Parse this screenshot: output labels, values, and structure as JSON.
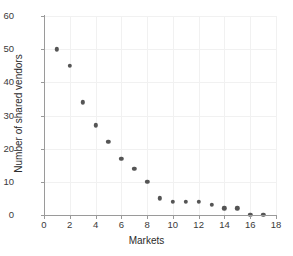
{
  "chart_data": {
    "type": "scatter",
    "title": "",
    "xlabel": "Markets",
    "ylabel": "Number of shared vendors",
    "x": [
      1,
      2,
      3,
      4,
      5,
      6,
      7,
      8,
      9,
      10,
      11,
      12,
      13,
      14,
      15,
      16,
      17
    ],
    "values": [
      50,
      45,
      34,
      27,
      22,
      17,
      14,
      10,
      5,
      4,
      4,
      4,
      3,
      2,
      2,
      0,
      0
    ],
    "series": [
      {
        "name": "shared vendors",
        "points": [
          {
            "x": 1,
            "y": 50
          },
          {
            "x": 2,
            "y": 45
          },
          {
            "x": 3,
            "y": 34
          },
          {
            "x": 4,
            "y": 27
          },
          {
            "x": 5,
            "y": 22
          },
          {
            "x": 6,
            "y": 17
          },
          {
            "x": 7,
            "y": 14
          },
          {
            "x": 8,
            "y": 10
          },
          {
            "x": 9,
            "y": 5
          },
          {
            "x": 10,
            "y": 4
          },
          {
            "x": 11,
            "y": 4
          },
          {
            "x": 12,
            "y": 4
          },
          {
            "x": 13,
            "y": 3
          },
          {
            "x": 14,
            "y": 2
          },
          {
            "x": 15,
            "y": 2
          },
          {
            "x": 16,
            "y": 0
          },
          {
            "x": 17,
            "y": 0
          }
        ]
      }
    ],
    "xlim": [
      0,
      18
    ],
    "ylim": [
      0,
      60
    ],
    "xticks": [
      0,
      2,
      4,
      6,
      8,
      10,
      12,
      14,
      16,
      18
    ],
    "yticks": [
      0,
      10,
      20,
      30,
      40,
      50,
      60
    ],
    "xtick_labels": [
      "0",
      "2",
      "4",
      "6",
      "8",
      "10",
      "12",
      "14",
      "16",
      "18"
    ],
    "ytick_labels": [
      "0",
      "10",
      "20",
      "30",
      "40",
      "50",
      "60"
    ],
    "grid": true,
    "grid_color": "#f1f1f1",
    "legend": null,
    "marker_color": "#555555",
    "axis_color": "#9a9a9a",
    "background": "#ffffff"
  }
}
